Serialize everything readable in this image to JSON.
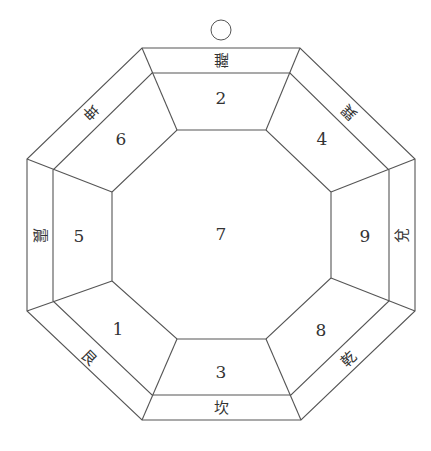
{
  "diagram": {
    "center_number": "7",
    "top_marker": "circle",
    "sectors": [
      {
        "position": "top",
        "number": "2",
        "trigram": "離",
        "trigram_orientation": "upside-down"
      },
      {
        "position": "top-right",
        "number": "4",
        "trigram": "巽"
      },
      {
        "position": "right",
        "number": "9",
        "trigram": "兌"
      },
      {
        "position": "bottom-right",
        "number": "8",
        "trigram": "乾"
      },
      {
        "position": "bottom",
        "number": "3",
        "trigram": "坎"
      },
      {
        "position": "bottom-left",
        "number": "1",
        "trigram": "艮"
      },
      {
        "position": "left",
        "number": "5",
        "trigram": "震"
      },
      {
        "position": "top-left",
        "number": "6",
        "trigram": "坤"
      }
    ]
  }
}
